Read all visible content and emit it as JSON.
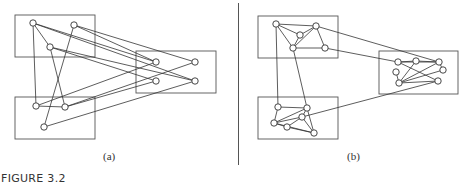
{
  "figure": {
    "label": "FIGURE 3.2",
    "panels": [
      {
        "id": "a",
        "caption": "(a)",
        "boxes": [
          {
            "x": 15,
            "y": 15,
            "w": 80,
            "h": 42
          },
          {
            "x": 15,
            "y": 97,
            "w": 80,
            "h": 42
          },
          {
            "x": 136,
            "y": 51,
            "w": 80,
            "h": 42
          }
        ],
        "nodes": [
          {
            "id": "a1",
            "x": 33,
            "y": 23
          },
          {
            "id": "a2",
            "x": 74,
            "y": 25
          },
          {
            "id": "a3",
            "x": 50,
            "y": 47
          },
          {
            "id": "b1",
            "x": 36,
            "y": 106
          },
          {
            "id": "b2",
            "x": 65,
            "y": 107
          },
          {
            "id": "b3",
            "x": 44,
            "y": 127
          },
          {
            "id": "c1",
            "x": 156,
            "y": 62
          },
          {
            "id": "c2",
            "x": 195,
            "y": 62
          },
          {
            "id": "c3",
            "x": 156,
            "y": 81
          },
          {
            "id": "c4",
            "x": 195,
            "y": 81
          }
        ],
        "edges": [
          [
            "a1",
            "b1"
          ],
          [
            "a1",
            "a3"
          ],
          [
            "a2",
            "b3"
          ],
          [
            "a3",
            "b2"
          ],
          [
            "b1",
            "b2"
          ],
          [
            "a1",
            "c1"
          ],
          [
            "a1",
            "c4"
          ],
          [
            "a2",
            "c1"
          ],
          [
            "a2",
            "c2"
          ],
          [
            "a3",
            "c3"
          ],
          [
            "a3",
            "c4"
          ],
          [
            "b1",
            "c1"
          ],
          [
            "b2",
            "c2"
          ],
          [
            "b2",
            "c3"
          ],
          [
            "b3",
            "c4"
          ]
        ]
      },
      {
        "id": "b",
        "caption": "(b)",
        "boxes": [
          {
            "x": 258,
            "y": 16,
            "w": 80,
            "h": 42
          },
          {
            "x": 258,
            "y": 97,
            "w": 80,
            "h": 42
          },
          {
            "x": 379,
            "y": 51,
            "w": 79,
            "h": 43
          }
        ],
        "nodes": [
          {
            "id": "p1",
            "x": 276,
            "y": 24
          },
          {
            "id": "p2",
            "x": 316,
            "y": 26
          },
          {
            "id": "p3",
            "x": 300,
            "y": 35
          },
          {
            "id": "p4",
            "x": 293,
            "y": 48
          },
          {
            "id": "p5",
            "x": 325,
            "y": 48
          },
          {
            "id": "q1",
            "x": 278,
            "y": 107
          },
          {
            "id": "q2",
            "x": 307,
            "y": 108
          },
          {
            "id": "q3",
            "x": 302,
            "y": 117
          },
          {
            "id": "q4",
            "x": 274,
            "y": 123
          },
          {
            "id": "q5",
            "x": 287,
            "y": 127
          },
          {
            "id": "q6",
            "x": 314,
            "y": 133
          },
          {
            "id": "r1",
            "x": 398,
            "y": 62
          },
          {
            "id": "r2",
            "x": 416,
            "y": 61
          },
          {
            "id": "r3",
            "x": 439,
            "y": 62
          },
          {
            "id": "r4",
            "x": 396,
            "y": 72
          },
          {
            "id": "r5",
            "x": 443,
            "y": 70
          },
          {
            "id": "r6",
            "x": 399,
            "y": 83
          },
          {
            "id": "r7",
            "x": 438,
            "y": 81
          }
        ],
        "edges": [
          [
            "p1",
            "p2"
          ],
          [
            "p1",
            "p3"
          ],
          [
            "p1",
            "p4"
          ],
          [
            "p2",
            "p3"
          ],
          [
            "p2",
            "p4"
          ],
          [
            "p3",
            "p4"
          ],
          [
            "p2",
            "p5"
          ],
          [
            "p4",
            "p5"
          ],
          [
            "p1",
            "q1"
          ],
          [
            "p4",
            "q2"
          ],
          [
            "p2",
            "r3"
          ],
          [
            "p5",
            "r1"
          ],
          [
            "q1",
            "q2"
          ],
          [
            "q1",
            "q4"
          ],
          [
            "q2",
            "q4"
          ],
          [
            "q2",
            "q3"
          ],
          [
            "q3",
            "q4"
          ],
          [
            "q3",
            "q5"
          ],
          [
            "q4",
            "q5"
          ],
          [
            "q2",
            "q6"
          ],
          [
            "q5",
            "q6"
          ],
          [
            "q3",
            "q6"
          ],
          [
            "q4",
            "q6"
          ],
          [
            "q3",
            "r7"
          ],
          [
            "r1",
            "r2"
          ],
          [
            "r1",
            "r3"
          ],
          [
            "r1",
            "r7"
          ],
          [
            "r2",
            "r6"
          ],
          [
            "r4",
            "r6"
          ],
          [
            "r3",
            "r5"
          ],
          [
            "r3",
            "r6"
          ],
          [
            "r5",
            "r6"
          ],
          [
            "r6",
            "r7"
          ],
          [
            "r2",
            "r3"
          ]
        ]
      }
    ]
  }
}
